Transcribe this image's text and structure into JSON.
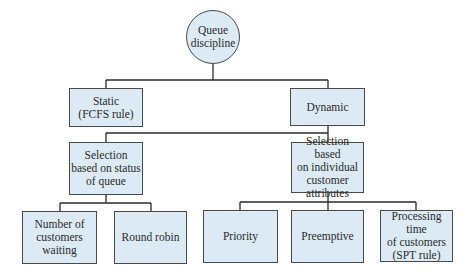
{
  "diagram": {
    "colors": {
      "node_fill": "#dbeaf4",
      "border": "#4a4a4a",
      "line": "#2a2a2a"
    },
    "root": {
      "label": "Queue\ndiscipline"
    },
    "level1": [
      {
        "id": "static",
        "label": "Static\n(FCFS rule)"
      },
      {
        "id": "dynamic",
        "label": "Dynamic"
      }
    ],
    "level2": [
      {
        "id": "status",
        "parent": "dynamic",
        "label": "Selection\nbased on status\nof queue"
      },
      {
        "id": "individual",
        "parent": "dynamic",
        "label": "Selection based\non individual\ncustomer\nattributes"
      }
    ],
    "level3": [
      {
        "id": "number",
        "parent": "status",
        "label": "Number of\ncustomers\nwaiting"
      },
      {
        "id": "roundrobin",
        "parent": "status",
        "label": "Round robin"
      },
      {
        "id": "priority",
        "parent": "individual",
        "label": "Priority"
      },
      {
        "id": "preemptive",
        "parent": "individual",
        "label": "Preemptive"
      },
      {
        "id": "processing",
        "parent": "individual",
        "label": "Processing time\nof customers\n(SPT rule)"
      }
    ]
  }
}
